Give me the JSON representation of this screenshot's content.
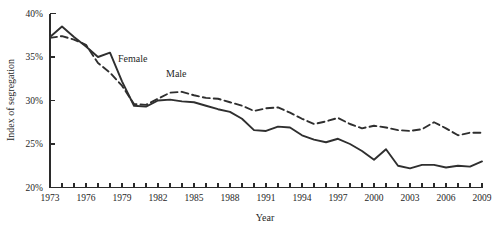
{
  "chart_data": {
    "type": "line",
    "title": "",
    "xlabel": "Year",
    "ylabel": "Index of segregation",
    "xlim": [
      1973,
      2009
    ],
    "ylim": [
      20,
      40
    ],
    "grid": false,
    "legend_position": "inline-annotation",
    "y_tick_labels": [
      "40%",
      "35%",
      "30%",
      "25%",
      "20%"
    ],
    "y_tick_values": [
      40,
      35,
      30,
      25,
      20
    ],
    "x_tick_labels": [
      "1973",
      "1976",
      "1979",
      "1982",
      "1985",
      "1988",
      "1991",
      "1994",
      "1997",
      "2000",
      "2003",
      "2006",
      "2009"
    ],
    "x_tick_values": [
      1973,
      1976,
      1979,
      1982,
      1985,
      1988,
      1991,
      1994,
      1997,
      2000,
      2003,
      2006,
      2009
    ],
    "x_minor_tick_values": [
      1973,
      1974,
      1975,
      1976,
      1977,
      1978,
      1979,
      1980,
      1981,
      1982,
      1983,
      1984,
      1985,
      1986,
      1987,
      1988,
      1989,
      1990,
      1991,
      1992,
      1993,
      1994,
      1995,
      1996,
      1997,
      1998,
      1999,
      2000,
      2001,
      2002,
      2003,
      2004,
      2005,
      2006,
      2007,
      2008,
      2009
    ],
    "x": [
      1973,
      1974,
      1975,
      1976,
      1977,
      1978,
      1979,
      1980,
      1981,
      1982,
      1983,
      1984,
      1985,
      1986,
      1987,
      1988,
      1989,
      1990,
      1991,
      1992,
      1993,
      1994,
      1995,
      1996,
      1997,
      1998,
      1999,
      2000,
      2001,
      2002,
      2003,
      2004,
      2005,
      2006,
      2007,
      2008,
      2009
    ],
    "series": [
      {
        "name": "Female",
        "style": "solid",
        "color": "#2f2f2f",
        "label": "Female",
        "values": [
          37.3,
          38.5,
          37.3,
          36.2,
          35.0,
          35.5,
          32.2,
          29.4,
          29.3,
          30.0,
          30.1,
          29.9,
          29.8,
          29.4,
          29.0,
          28.7,
          27.9,
          26.6,
          26.5,
          27.0,
          26.9,
          26.0,
          25.5,
          25.2,
          25.6,
          25.0,
          24.2,
          23.2,
          24.4,
          22.5,
          22.2,
          22.6,
          22.6,
          22.3,
          22.5,
          22.4,
          23.0
        ]
      },
      {
        "name": "Male",
        "style": "dashed",
        "color": "#2f2f2f",
        "label": "Male",
        "values": [
          37.2,
          37.4,
          37.0,
          36.4,
          34.3,
          33.2,
          31.7,
          29.6,
          29.5,
          30.2,
          30.9,
          31.0,
          30.6,
          30.3,
          30.2,
          29.8,
          29.4,
          28.8,
          29.1,
          29.2,
          28.6,
          27.9,
          27.3,
          27.6,
          28.0,
          27.3,
          26.8,
          27.1,
          26.9,
          26.6,
          26.5,
          26.7,
          27.5,
          26.8,
          26.0,
          26.3,
          26.3
        ]
      }
    ]
  }
}
